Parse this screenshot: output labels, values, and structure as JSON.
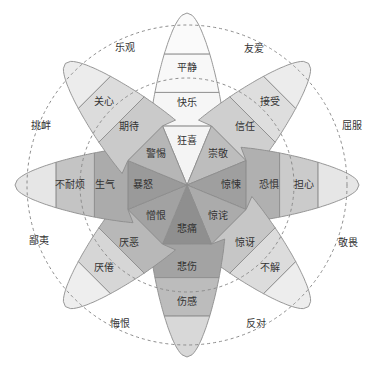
{
  "center": [
    187,
    185
  ],
  "colors": {
    "stroke": "#8c8c8c",
    "dash": "#8c8c8c",
    "text": "#333333",
    "ring_inner_light": "#e6e6e6",
    "ring_inner_mid": "#c8c8c8",
    "ring_inner_dark": "#a8a8a8"
  },
  "petals": [
    {
      "dir": 0,
      "intense": "狂喜",
      "basic": "快乐",
      "mild": "平静",
      "shades": [
        "#f4f4f4",
        "#f6f6f6",
        "#f8f8f8",
        "#fafafa"
      ]
    },
    {
      "dir": 45,
      "intense": "崇敬",
      "basic": "信任",
      "mild": "接受",
      "shades": [
        "#bdbdbd",
        "#cfcfcf",
        "#dedede",
        "#ececec"
      ]
    },
    {
      "dir": 90,
      "intense": "惊悚",
      "basic": "恐惧",
      "mild": "担心",
      "shades": [
        "#9f9f9f",
        "#b0b0b0",
        "#cbcbcb",
        "#e6e6e6"
      ]
    },
    {
      "dir": 135,
      "intense": "惊诧",
      "basic": "惊讶",
      "mild": "不解",
      "shades": [
        "#ababab",
        "#c6c6c6",
        "#dcdcdc",
        "#ededed"
      ]
    },
    {
      "dir": 180,
      "intense": "悲痛",
      "basic": "悲伤",
      "mild": "伤感",
      "shades": [
        "#8f8f8f",
        "#a3a3a3",
        "#bcbcbc",
        "#d8d8d8"
      ]
    },
    {
      "dir": 225,
      "intense": "憎恨",
      "basic": "厌恶",
      "mild": "厌倦",
      "shades": [
        "#a2a2a2",
        "#b8b8b8",
        "#d6d6d6",
        "#eeeeee"
      ]
    },
    {
      "dir": 270,
      "intense": "暴怒",
      "basic": "生气",
      "mild": "不耐烦",
      "shades": [
        "#9a9a9a",
        "#ababab",
        "#c4c4c4",
        "#e6e6e6"
      ]
    },
    {
      "dir": 315,
      "intense": "警惕",
      "basic": "期待",
      "mild": "关心",
      "shades": [
        "#b6b6b6",
        "#cacaca",
        "#dcdcdc",
        "#ececec"
      ]
    }
  ],
  "dyads": [
    {
      "dir": 22.5,
      "label": "友爱"
    },
    {
      "dir": 67.5,
      "label": "屈服"
    },
    {
      "dir": 112.5,
      "label": "敬畏"
    },
    {
      "dir": 157.5,
      "label": "反对"
    },
    {
      "dir": 202.5,
      "label": "悔恨"
    },
    {
      "dir": 247.5,
      "label": "鄙夷"
    },
    {
      "dir": 292.5,
      "label": "挑衅"
    },
    {
      "dir": 337.5,
      "label": "乐观"
    }
  ],
  "labels_pos": {
    "乐观": [
      125,
      48
    ],
    "友爱": [
      254,
      49
    ],
    "屈服": [
      352,
      126
    ],
    "敬畏": [
      348,
      243
    ],
    "反对": [
      256,
      324
    ],
    "悔恨": [
      120,
      324
    ],
    "鄙夷": [
      39,
      241
    ],
    "挑衅": [
      41,
      126
    ]
  }
}
